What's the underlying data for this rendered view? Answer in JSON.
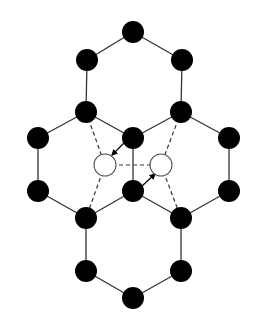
{
  "diagram": {
    "width": 257,
    "height": 327,
    "colors": {
      "atom": "#000000",
      "vacancy_fill": "#ffffff",
      "bond": "#333333",
      "background": "#ffffff"
    },
    "atom_radius": 11,
    "vacancy_radius": 11,
    "atoms": [
      {
        "id": "a1",
        "x": 133,
        "y": 32
      },
      {
        "id": "a2",
        "x": 87,
        "y": 60
      },
      {
        "id": "a3",
        "x": 182,
        "y": 60
      },
      {
        "id": "a4",
        "x": 86,
        "y": 112
      },
      {
        "id": "a5",
        "x": 181,
        "y": 112
      },
      {
        "id": "a6",
        "x": 38,
        "y": 138
      },
      {
        "id": "a7",
        "x": 133,
        "y": 138
      },
      {
        "id": "a8",
        "x": 229,
        "y": 138
      },
      {
        "id": "a9",
        "x": 38,
        "y": 191
      },
      {
        "id": "a10",
        "x": 133,
        "y": 191
      },
      {
        "id": "a11",
        "x": 229,
        "y": 191
      },
      {
        "id": "a12",
        "x": 86,
        "y": 218
      },
      {
        "id": "a13",
        "x": 181,
        "y": 218
      },
      {
        "id": "a14",
        "x": 86,
        "y": 271
      },
      {
        "id": "a15",
        "x": 181,
        "y": 271
      },
      {
        "id": "a16",
        "x": 133,
        "y": 298
      }
    ],
    "vacancies": [
      {
        "id": "v1",
        "x": 105,
        "y": 165
      },
      {
        "id": "v2",
        "x": 161,
        "y": 165
      }
    ],
    "bonds": [
      [
        "a1",
        "a2"
      ],
      [
        "a1",
        "a3"
      ],
      [
        "a2",
        "a4"
      ],
      [
        "a3",
        "a5"
      ],
      [
        "a4",
        "a6"
      ],
      [
        "a4",
        "a7"
      ],
      [
        "a5",
        "a7"
      ],
      [
        "a5",
        "a8"
      ],
      [
        "a6",
        "a9"
      ],
      [
        "a8",
        "a11"
      ],
      [
        "a7",
        "a10"
      ],
      [
        "a9",
        "a12"
      ],
      [
        "a10",
        "a12"
      ],
      [
        "a10",
        "a13"
      ],
      [
        "a11",
        "a13"
      ],
      [
        "a12",
        "a14"
      ],
      [
        "a13",
        "a15"
      ],
      [
        "a14",
        "a16"
      ],
      [
        "a15",
        "a16"
      ]
    ],
    "dashed_bonds": [
      [
        "a4",
        "v1"
      ],
      [
        "v1",
        "a12"
      ],
      [
        "a5",
        "v2"
      ],
      [
        "v2",
        "a13"
      ],
      [
        "v1",
        "v2"
      ]
    ],
    "arrows": [
      {
        "from": "a7",
        "to": "v1",
        "x1": 124,
        "y1": 143,
        "x2": 112,
        "y2": 155
      },
      {
        "from": "a10",
        "to": "v2",
        "x1": 142,
        "y1": 186,
        "x2": 155,
        "y2": 174
      }
    ]
  }
}
